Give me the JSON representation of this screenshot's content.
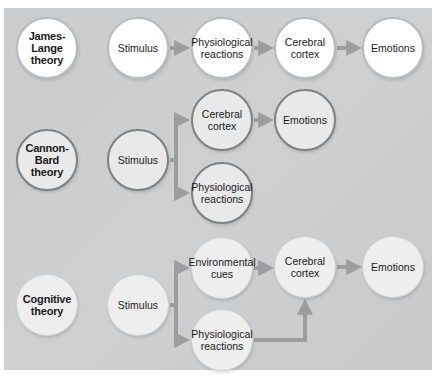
{
  "diagram": {
    "colors": {
      "background": "#cbcccd",
      "arrow": "#9c9d9e",
      "james_lange_fill": "#ffffff",
      "cannon_bard_fill": "#e9e9e9",
      "cannon_bard_border": "#7f8081",
      "cognitive_fill": "#eeeeee"
    },
    "james_lange": {
      "theory": "James-Lange theory",
      "nodes": [
        "Stimulus",
        "Physiological reactions",
        "Cerebral cortex",
        "Emotions"
      ],
      "flow": "Stimulus → Physiological reactions → Cerebral cortex → Emotions"
    },
    "cannon_bard": {
      "theory": "Cannon-Bard theory",
      "stimulus": "Stimulus",
      "branch_top": "Cerebral cortex",
      "branch_top_next": "Emotions",
      "branch_bottom": "Physiological reactions",
      "flow": "Stimulus → (Cerebral cortex → Emotions) and (Physiological reactions)"
    },
    "cognitive": {
      "theory": "Cognitive theory",
      "stimulus": "Stimulus",
      "branch_top": "Environmental cues",
      "branch_bottom": "Physiological reactions",
      "merge": "Cerebral cortex",
      "result": "Emotions",
      "flow": "Stimulus → (Environmental cues, Physiological reactions) → Cerebral cortex → Emotions"
    }
  }
}
